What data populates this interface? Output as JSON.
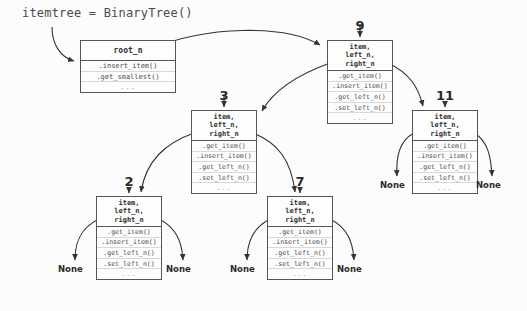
{
  "diagram": {
    "title": "itemtree = BinaryTree()",
    "tree_box": {
      "header": "root_n",
      "methods": [
        ".insert_item()",
        ".get_smallest()",
        "..."
      ]
    },
    "node_header_lines": [
      "item,",
      "left_n,",
      "right_n"
    ],
    "node_methods": [
      ".get_item()",
      ".insert_item()",
      ".get_left_n()",
      ".set_left_n()",
      "..."
    ],
    "none_label": "None",
    "nodes": [
      {
        "id": "n9",
        "label": "9"
      },
      {
        "id": "n3",
        "label": "3"
      },
      {
        "id": "n11",
        "label": "11"
      },
      {
        "id": "n2",
        "label": "2"
      },
      {
        "id": "n7",
        "label": "7"
      }
    ],
    "none_leaves": [
      {
        "id": "none-n2-left",
        "label": "None"
      },
      {
        "id": "none-n2-right",
        "label": "None"
      },
      {
        "id": "none-n7-left",
        "label": "None"
      },
      {
        "id": "none-n7-right",
        "label": "None"
      },
      {
        "id": "none-n11-left",
        "label": "None"
      },
      {
        "id": "none-n11-right",
        "label": "None"
      }
    ],
    "colors": {
      "stroke": "#555555",
      "text": "#4a4a4a",
      "background": "#fcfcfc",
      "divider": "#d8d8d8"
    }
  }
}
